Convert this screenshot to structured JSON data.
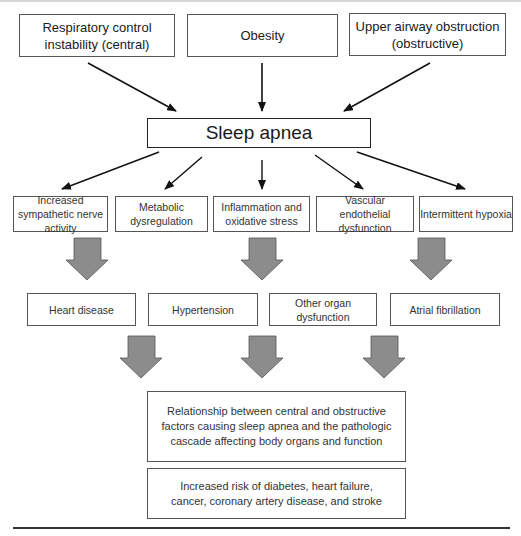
{
  "figure": {
    "causes": [
      {
        "label": "Respiratory control instability (central)"
      },
      {
        "label": "Obesity"
      },
      {
        "label": "Upper airway obstruction (obstructive)"
      }
    ],
    "central": {
      "label": "Sleep apnea"
    },
    "mechanisms": [
      {
        "label": "Increased sympathetic nerve activity"
      },
      {
        "label": "Metabolic dysregulation"
      },
      {
        "label": "Inflammation and oxidative stress"
      },
      {
        "label": "Vascular endothelial dysfunction"
      },
      {
        "label": "Intermittent hypoxia"
      }
    ],
    "outcomes": [
      {
        "label": "Heart disease"
      },
      {
        "label": "Hypertension"
      },
      {
        "label": "Other organ dysfunction"
      },
      {
        "label": "Atrial fibrillation"
      }
    ],
    "summary": {
      "label": "Relationship between central and obstructive factors causing sleep apnea and the pathologic cascade affecting body organs and function"
    },
    "risk": {
      "label": "Increased risk of diabetes, heart failure, cancer, coronary artery disease, and stroke"
    },
    "colors": {
      "block_arrow_fill": "#8c8c8c",
      "block_arrow_stroke": "#555555",
      "line": "#111111"
    }
  }
}
